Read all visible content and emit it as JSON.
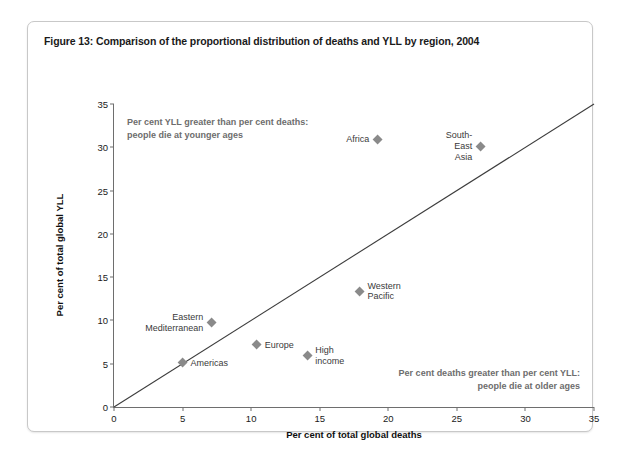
{
  "figure": {
    "title": "Figure 13: Comparison of the proportional distribution of deaths and YLL by region, 2004"
  },
  "annotations": {
    "upper_left": "Per cent YLL greater than per cent deaths:\npeople die at younger ages",
    "lower_right": "Per cent deaths greater than per cent YLL:\npeople die at older ages"
  },
  "colors": {
    "marker": "#8a8a8a",
    "axis": "#6e6e6e",
    "annotation_text": "#6d6d6d",
    "diagonal_line": "#3c3c3c",
    "frame_border": "#c8c8c8"
  },
  "chart_data": {
    "type": "scatter",
    "title": "Figure 13: Comparison of the proportional distribution of deaths and YLL by region, 2004",
    "xlabel": "Per cent of total global deaths",
    "ylabel": "Per cent of total global YLL",
    "xlim": [
      0,
      35
    ],
    "ylim": [
      0,
      35
    ],
    "xticks": [
      0,
      5,
      10,
      15,
      20,
      25,
      30,
      35
    ],
    "yticks": [
      0,
      5,
      10,
      15,
      20,
      25,
      30,
      35
    ],
    "grid": false,
    "legend": "none",
    "reference_line": {
      "type": "identity",
      "label": "y = x",
      "from": [
        0,
        0
      ],
      "to": [
        35,
        35
      ]
    },
    "points": [
      {
        "label": "Africa",
        "x": 19.2,
        "y": 30.9,
        "label_side": "left"
      },
      {
        "label": "South-East Asia",
        "x": 26.7,
        "y": 30.1,
        "label_side": "left"
      },
      {
        "label": "Western Pacific",
        "x": 17.9,
        "y": 13.3,
        "label_side": "right"
      },
      {
        "label": "Eastern\nMediterranean",
        "x": 7.1,
        "y": 9.7,
        "label_side": "left"
      },
      {
        "label": "Europe",
        "x": 10.4,
        "y": 7.2,
        "label_side": "right"
      },
      {
        "label": "High income",
        "x": 14.1,
        "y": 5.9,
        "label_side": "right"
      },
      {
        "label": "Americas",
        "x": 5.0,
        "y": 5.1,
        "label_side": "right"
      }
    ]
  }
}
